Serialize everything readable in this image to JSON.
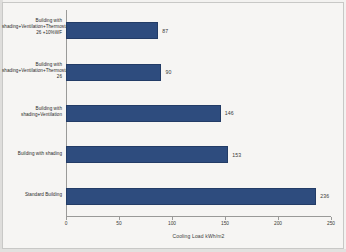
{
  "chart_data": {
    "type": "bar",
    "orientation": "horizontal",
    "title": "",
    "xlabel": "Cooling Load kWh/m2",
    "ylabel": "",
    "xlim": [
      0,
      250
    ],
    "xticks": [
      0,
      50,
      100,
      150,
      200,
      250
    ],
    "grid": false,
    "legend": false,
    "bar_color": "#2e4c7e",
    "categories": [
      "Building with shading+Ventilation+Thermostat 26 +10%WF",
      "Building with shading+Ventilation+Thermostat 26",
      "Building with shading+Ventilation",
      "Building with shading",
      "Standard Building"
    ],
    "values": [
      87,
      90,
      146,
      153,
      236
    ],
    "value_labels": [
      "87",
      "90",
      "146",
      "153",
      "236"
    ],
    "tick_labels": [
      "0",
      "50",
      "100",
      "150",
      "200",
      "250"
    ]
  }
}
